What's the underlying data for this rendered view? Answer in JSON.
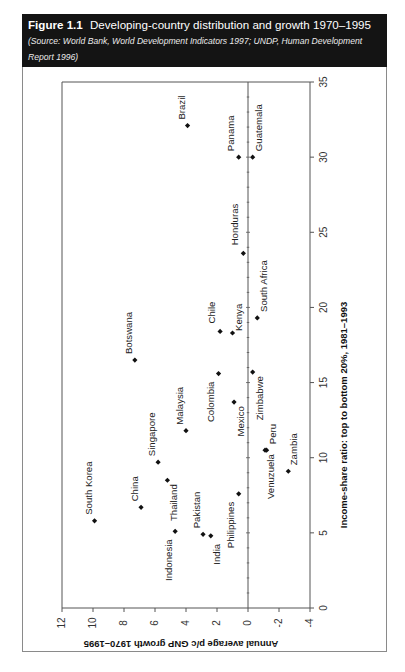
{
  "figure": {
    "number": "Figure 1.1",
    "title": "Developing-country distribution and growth 1970–1995",
    "source_line1_a": "(Source: World Bank, ",
    "source_line1_b": "World Development Indicators 1997",
    "source_line1_c": "; UNDP, ",
    "source_line1_d": "Human Development",
    "source_line2": "Report 1996)"
  },
  "colors": {
    "header_bg": "#141414",
    "header_text": "#ffffff",
    "marker": "#111111",
    "axis": "#555555"
  },
  "chart_data": {
    "type": "scatter",
    "title": "Developing-country distribution and growth 1970–1995",
    "xlabel": "Income-share ratio: top to bottom 20%, 1981–1993",
    "ylabel": "Annual average p/c GNP growth 1970–1995",
    "xlim": [
      0,
      35
    ],
    "ylim": [
      -4,
      12
    ],
    "x_ticks": [
      0,
      5,
      10,
      15,
      20,
      25,
      30,
      35
    ],
    "y_ticks": [
      12,
      10,
      8,
      6,
      4,
      2,
      0,
      -2,
      -4
    ],
    "y_tick_labels": [
      "12",
      "10",
      "8",
      "6",
      "4",
      "2",
      "0",
      "-2",
      "-4"
    ],
    "grid": false,
    "zero_line": true,
    "orientation_note": "rendered rotated 90 degrees: x-axis runs bottom-to-top along right side, y-axis runs right-to-left along bottom",
    "points": [
      {
        "label": "Brazil",
        "x": 32.1,
        "y": 3.9
      },
      {
        "label": "Panama",
        "x": 30.0,
        "y": 0.6
      },
      {
        "label": "Guatemala",
        "x": 30.0,
        "y": -0.3
      },
      {
        "label": "Honduras",
        "x": 23.6,
        "y": 0.3
      },
      {
        "label": "South Africa",
        "x": 19.3,
        "y": -0.6
      },
      {
        "label": "Chile",
        "x": 18.4,
        "y": 1.8
      },
      {
        "label": "Kenya",
        "x": 18.3,
        "y": 1.0
      },
      {
        "label": "Botswana",
        "x": 16.5,
        "y": 7.3
      },
      {
        "label": "Zimbabwe",
        "x": 15.7,
        "y": -0.3
      },
      {
        "label": "Colombia",
        "x": 15.6,
        "y": 1.9
      },
      {
        "label": "Mexico",
        "x": 13.7,
        "y": 0.9
      },
      {
        "label": "Malaysia",
        "x": 11.8,
        "y": 4.0
      },
      {
        "label": "Venuzuela",
        "x": 10.5,
        "y": -1.1
      },
      {
        "label": "Peru",
        "x": 10.5,
        "y": -1.2
      },
      {
        "label": "Singapore",
        "x": 9.7,
        "y": 5.8
      },
      {
        "label": "Zambia",
        "x": 9.1,
        "y": -2.6
      },
      {
        "label": "Thailand",
        "x": 8.5,
        "y": 5.2
      },
      {
        "label": "Philippines",
        "x": 7.6,
        "y": 0.6
      },
      {
        "label": "China",
        "x": 6.7,
        "y": 6.9
      },
      {
        "label": "South Korea",
        "x": 5.8,
        "y": 9.9
      },
      {
        "label": "Indonesia",
        "x": 5.1,
        "y": 4.7
      },
      {
        "label": "Pakistan",
        "x": 4.9,
        "y": 2.9
      },
      {
        "label": "India",
        "x": 4.8,
        "y": 2.4
      }
    ]
  },
  "label_placement": {
    "Brazil": {
      "dx": -6,
      "dy": -6,
      "anchor": "start"
    },
    "Panama": {
      "dx": -8,
      "dy": -6,
      "anchor": "start"
    },
    "Guatemala": {
      "dx": 6,
      "dy": -6,
      "anchor": "start"
    },
    "Honduras": {
      "dx": -8,
      "dy": -8,
      "anchor": "start"
    },
    "South Africa": {
      "dx": 7,
      "dy": -6,
      "anchor": "start"
    },
    "Chile": {
      "dx": -8,
      "dy": -8,
      "anchor": "start"
    },
    "Kenya": {
      "dx": 6,
      "dy": -2,
      "anchor": "start"
    },
    "Botswana": {
      "dx": -6,
      "dy": -6,
      "anchor": "start"
    },
    "Zimbabwe": {
      "dx": 7,
      "dy": 4,
      "anchor": "end"
    },
    "Colombia": {
      "dx": -8,
      "dy": 8,
      "anchor": "end"
    },
    "Mexico": {
      "dx": 7,
      "dy": 4,
      "anchor": "end"
    },
    "Malaysia": {
      "dx": -6,
      "dy": -6,
      "anchor": "start"
    },
    "Venuzuela": {
      "dx": 6,
      "dy": 4,
      "anchor": "end"
    },
    "Peru": {
      "dx": 6,
      "dy": -6,
      "anchor": "start"
    },
    "Singapore": {
      "dx": -6,
      "dy": -6,
      "anchor": "start"
    },
    "Zambia": {
      "dx": 6,
      "dy": -6,
      "anchor": "start"
    },
    "Thailand": {
      "dx": 7,
      "dy": 4,
      "anchor": "end"
    },
    "Philippines": {
      "dx": -8,
      "dy": 8,
      "anchor": "end"
    },
    "China": {
      "dx": -6,
      "dy": -6,
      "anchor": "start"
    },
    "South Korea": {
      "dx": -6,
      "dy": -6,
      "anchor": "start"
    },
    "Indonesia": {
      "dx": -6,
      "dy": 8,
      "anchor": "end"
    },
    "Pakistan": {
      "dx": -6,
      "dy": -6,
      "anchor": "start"
    },
    "India": {
      "dx": 6,
      "dy": 8,
      "anchor": "end"
    }
  }
}
